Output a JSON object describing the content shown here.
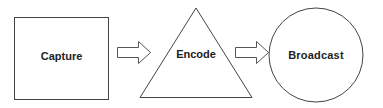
{
  "diagram": {
    "type": "flow",
    "nodes": [
      {
        "id": "capture",
        "shape": "square",
        "label": "Capture"
      },
      {
        "id": "encode",
        "shape": "triangle",
        "label": "Encode"
      },
      {
        "id": "broadcast",
        "shape": "circle",
        "label": "Broadcast"
      }
    ],
    "edges": [
      {
        "from": "capture",
        "to": "encode",
        "style": "block-arrow"
      },
      {
        "from": "encode",
        "to": "broadcast",
        "style": "block-arrow"
      }
    ],
    "colors": {
      "stroke": "#444444",
      "fill": "#ffffff",
      "text": "#222222"
    }
  }
}
